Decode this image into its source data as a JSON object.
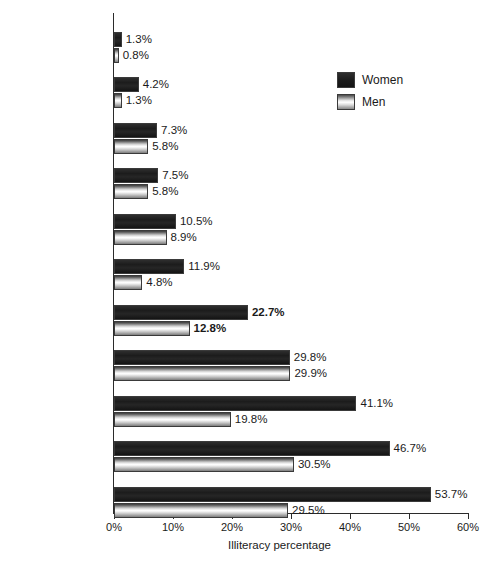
{
  "chart_data": {
    "type": "bar",
    "orientation": "horizontal",
    "title": "",
    "xlabel": "Illiteracy percentage",
    "ylabel": "",
    "xlim": [
      0,
      60
    ],
    "grid": false,
    "tick_labels": [
      "0%",
      "10%",
      "20%",
      "30%",
      "40%",
      "50%",
      "60%"
    ],
    "tick_values": [
      0,
      10,
      20,
      30,
      40,
      50,
      60
    ],
    "legend": {
      "position": "top-right",
      "entries": [
        {
          "name": "Women",
          "color": "#232323"
        },
        {
          "name": "Men",
          "color": "#e0e0e0"
        }
      ]
    },
    "categories": [
      "North America and\nWestern Europe",
      "Central and\nEastern Europe",
      "Oceania",
      "The Pacific",
      "Latin America",
      "East Asia",
      "Worldwide",
      "Caribbean",
      "Arab States",
      "Sub-Saharan Africa",
      "South and West Asia"
    ],
    "category_emphasis": [
      false,
      false,
      false,
      false,
      false,
      false,
      true,
      false,
      false,
      false,
      false
    ],
    "series": [
      {
        "name": "Women",
        "values": [
          1.3,
          4.2,
          7.3,
          7.5,
          10.5,
          11.9,
          22.7,
          29.8,
          41.1,
          46.7,
          53.7
        ],
        "labels": [
          "1.3%",
          "4.2%",
          "7.3%",
          "7.5%",
          "10.5%",
          "11.9%",
          "22.7%",
          "29.8%",
          "41.1%",
          "46.7%",
          "53.7%"
        ]
      },
      {
        "name": "Men",
        "values": [
          0.8,
          1.3,
          5.8,
          5.8,
          8.9,
          4.8,
          12.8,
          29.9,
          19.8,
          30.5,
          29.5
        ],
        "labels": [
          "0.8%",
          "1.3%",
          "5.8%",
          "5.8%",
          "8.9%",
          "4.8%",
          "12.8%",
          "29.9%",
          "19.8%",
          "30.5%",
          "29.5%"
        ]
      }
    ]
  }
}
